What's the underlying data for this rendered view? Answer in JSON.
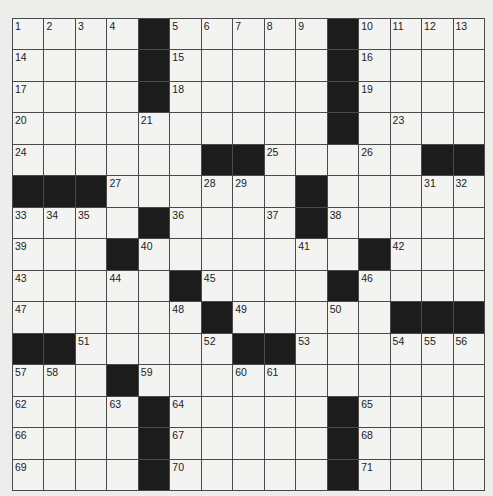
{
  "puzzle": {
    "rows": 15,
    "cols": 15,
    "colors": {
      "background": "#ededeb",
      "cell": "#f3f3f1",
      "block": "#1c1c1c",
      "line": "#4a4a4a"
    },
    "layout": [
      "....#.....#....",
      "....#.....#....",
      "....#.....#....",
      "..........#....",
      "......##.....##",
      "###......#.....",
      "....#....#.....",
      "...#.......#...",
      ".....#....#....",
      "......#.....###",
      "##.....##......",
      "...#...........",
      "....#.....#....",
      "....#.....#....",
      "....#.....#...."
    ],
    "numbers": [
      [
        1,
        2,
        3,
        4,
        0,
        5,
        6,
        7,
        8,
        9,
        0,
        10,
        11,
        12,
        13
      ],
      [
        14,
        0,
        0,
        0,
        0,
        15,
        0,
        0,
        0,
        0,
        0,
        16,
        0,
        0,
        0
      ],
      [
        17,
        0,
        0,
        0,
        0,
        18,
        0,
        0,
        0,
        0,
        0,
        19,
        0,
        0,
        0
      ],
      [
        20,
        0,
        0,
        0,
        21,
        0,
        0,
        0,
        0,
        0,
        22,
        0,
        23,
        0,
        0
      ],
      [
        24,
        0,
        0,
        0,
        0,
        0,
        0,
        0,
        25,
        0,
        0,
        26,
        0,
        0,
        0
      ],
      [
        0,
        0,
        0,
        27,
        0,
        0,
        28,
        29,
        0,
        30,
        0,
        0,
        0,
        31,
        32
      ],
      [
        33,
        34,
        35,
        0,
        0,
        36,
        0,
        0,
        37,
        0,
        38,
        0,
        0,
        0,
        0
      ],
      [
        39,
        0,
        0,
        0,
        40,
        0,
        0,
        0,
        0,
        41,
        0,
        0,
        42,
        0,
        0
      ],
      [
        43,
        0,
        0,
        44,
        0,
        0,
        45,
        0,
        0,
        0,
        0,
        46,
        0,
        0,
        0
      ],
      [
        47,
        0,
        0,
        0,
        0,
        48,
        0,
        49,
        0,
        0,
        50,
        0,
        0,
        0,
        0
      ],
      [
        0,
        0,
        51,
        0,
        0,
        0,
        52,
        0,
        0,
        53,
        0,
        0,
        54,
        55,
        56
      ],
      [
        57,
        58,
        0,
        0,
        59,
        0,
        0,
        60,
        61,
        0,
        0,
        0,
        0,
        0,
        0
      ],
      [
        62,
        0,
        0,
        63,
        0,
        64,
        0,
        0,
        0,
        0,
        0,
        65,
        0,
        0,
        0
      ],
      [
        66,
        0,
        0,
        0,
        0,
        67,
        0,
        0,
        0,
        0,
        0,
        68,
        0,
        0,
        0
      ],
      [
        69,
        0,
        0,
        0,
        0,
        70,
        0,
        0,
        0,
        0,
        0,
        71,
        0,
        0,
        0
      ]
    ],
    "letters": []
  }
}
